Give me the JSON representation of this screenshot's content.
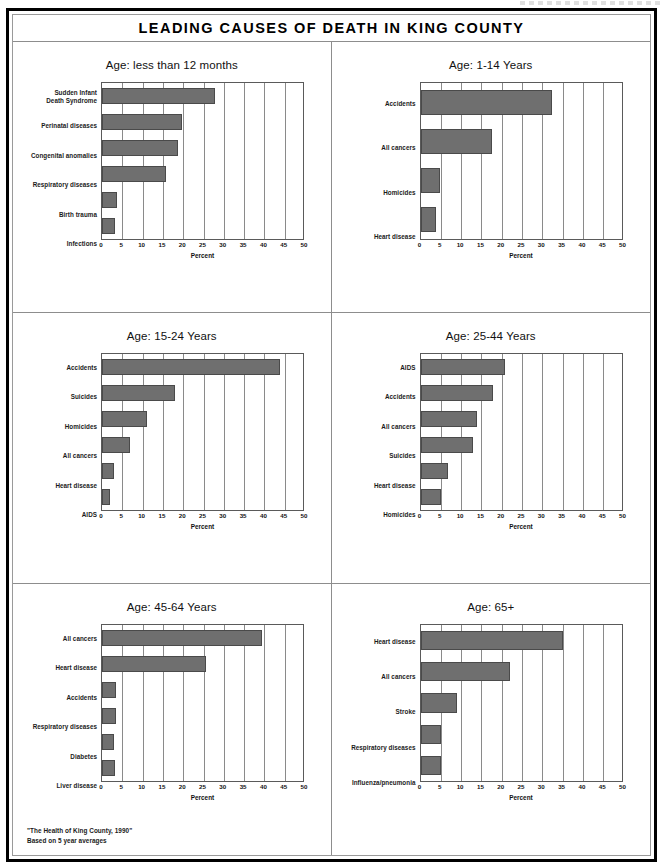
{
  "banner": {
    "title": "LEADING CAUSES OF DEATH IN KING COUNTY"
  },
  "axis": {
    "xlabel": "Percent",
    "ticks": [
      "0",
      "5",
      "10",
      "15",
      "20",
      "25",
      "30",
      "35",
      "40",
      "45",
      "50"
    ],
    "xmin": 0,
    "xmax": 50
  },
  "footnote": {
    "line1": "\"The Health of King County, 1990\"",
    "line2": "Based on 5 year averages"
  },
  "colors": {
    "bar_fill": "#6f6f6f",
    "bar_stroke": "#4a4a4a",
    "grid": "#8a8a8a",
    "frame": "#000000",
    "divider": "#8d8d8d",
    "text": "#111111"
  },
  "chart_data": [
    {
      "type": "bar",
      "orientation": "horizontal",
      "title": "Age: less than 12 months",
      "xlabel": "Percent",
      "ylabel": "",
      "xlim": [
        0,
        50
      ],
      "grid": true,
      "legend": "none",
      "categories": [
        "Sudden Infant\nDeath Syndrome",
        "Perinatal diseases",
        "Congenital anomalies",
        "Respiratory diseases",
        "Birth trauma",
        "Infections"
      ],
      "category_lines": [
        [
          "Sudden Infant",
          "Death Syndrome"
        ],
        [
          "Perinatal diseases"
        ],
        [
          "Congenital anomalies"
        ],
        [
          "Respiratory diseases"
        ],
        [
          "Birth trauma"
        ],
        [
          "Infections"
        ]
      ],
      "values": [
        27.8,
        19.8,
        18.8,
        15.8,
        3.8,
        3.2
      ]
    },
    {
      "type": "bar",
      "orientation": "horizontal",
      "title": "Age: 1-14 Years",
      "xlabel": "Percent",
      "ylabel": "",
      "xlim": [
        0,
        50
      ],
      "grid": true,
      "legend": "none",
      "categories": [
        "Accidents",
        "All cancers",
        "Homicides",
        "Heart disease"
      ],
      "category_lines": [
        [
          "Accidents"
        ],
        [
          "All cancers"
        ],
        [
          "Homicides"
        ],
        [
          "Heart disease"
        ]
      ],
      "values": [
        32.5,
        17.7,
        4.8,
        3.8
      ]
    },
    {
      "type": "bar",
      "orientation": "horizontal",
      "title": "Age: 15-24 Years",
      "xlabel": "Percent",
      "ylabel": "",
      "xlim": [
        0,
        50
      ],
      "grid": true,
      "legend": "none",
      "categories": [
        "Accidents",
        "Suicides",
        "Homicides",
        "All cancers",
        "Heart disease",
        "AIDS"
      ],
      "category_lines": [
        [
          "Accidents"
        ],
        [
          "Suicides"
        ],
        [
          "Homicides"
        ],
        [
          "All cancers"
        ],
        [
          "Heart disease"
        ],
        [
          "AIDS"
        ]
      ],
      "values": [
        43.8,
        18.0,
        11.0,
        7.0,
        3.0,
        2.0
      ]
    },
    {
      "type": "bar",
      "orientation": "horizontal",
      "title": "Age: 25-44 Years",
      "xlabel": "Percent",
      "ylabel": "",
      "xlim": [
        0,
        50
      ],
      "grid": true,
      "legend": "none",
      "categories": [
        "AIDS",
        "Accidents",
        "All cancers",
        "Suicides",
        "Heart disease",
        "Homicides"
      ],
      "category_lines": [
        [
          "AIDS"
        ],
        [
          "Accidents"
        ],
        [
          "All cancers"
        ],
        [
          "Suicides"
        ],
        [
          "Heart disease"
        ],
        [
          "Homicides"
        ]
      ],
      "values": [
        20.8,
        17.8,
        14.0,
        13.0,
        6.7,
        5.0
      ]
    },
    {
      "type": "bar",
      "orientation": "horizontal",
      "title": "Age: 45-64 Years",
      "xlabel": "Percent",
      "ylabel": "",
      "xlim": [
        0,
        50
      ],
      "grid": true,
      "legend": "none",
      "categories": [
        "All cancers",
        "Heart disease",
        "Accidents",
        "Respiratory diseases",
        "Diabetes",
        "Liver disease"
      ],
      "category_lines": [
        [
          "All cancers"
        ],
        [
          "Heart disease"
        ],
        [
          "Accidents"
        ],
        [
          "Respiratory diseases"
        ],
        [
          "Diabetes"
        ],
        [
          "Liver disease"
        ]
      ],
      "values": [
        39.5,
        25.7,
        3.5,
        3.5,
        3.0,
        3.2
      ]
    },
    {
      "type": "bar",
      "orientation": "horizontal",
      "title": "Age: 65+",
      "xlabel": "Percent",
      "ylabel": "",
      "xlim": [
        0,
        50
      ],
      "grid": true,
      "legend": "none",
      "categories": [
        "Heart disease",
        "All cancers",
        "Stroke",
        "Respiratory diseases",
        "Influenza/pneumonia"
      ],
      "category_lines": [
        [
          "Heart disease"
        ],
        [
          "All cancers"
        ],
        [
          "Stroke"
        ],
        [
          "Respiratory diseases"
        ],
        [
          "Influenza/pneumonia"
        ]
      ],
      "values": [
        35.0,
        22.0,
        9.0,
        5.0,
        5.0
      ]
    }
  ]
}
